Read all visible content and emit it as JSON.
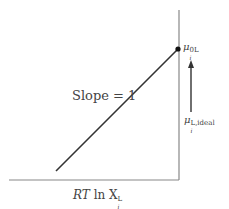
{
  "diagram": {
    "slope_label": "Slope = 1",
    "x_axis_label": {
      "prefix": "RT",
      "middle": " ln X",
      "superscript": "L",
      "subscript": "i"
    },
    "top_label": {
      "symbol": "μ",
      "superscript": "0L",
      "subscript": "i"
    },
    "ideal_label": {
      "symbol": "μ",
      "superscript": "L,ideal",
      "subscript": "i"
    },
    "colors": {
      "axis": "#888888",
      "line": "#333333",
      "arrow": "#333333",
      "point": "#111111"
    },
    "geometry": {
      "x_axis": {
        "x1": 9,
        "y": 180,
        "x2": 179
      },
      "y_axis": {
        "x": 179,
        "y1": 10,
        "y2": 180
      },
      "slope_line": {
        "x1": 56,
        "y1": 171,
        "x2": 178,
        "y2": 49
      },
      "point": {
        "cx": 178,
        "cy": 49
      },
      "arrow": {
        "x": 191,
        "y_tail": 112,
        "y_head": 61
      }
    }
  }
}
